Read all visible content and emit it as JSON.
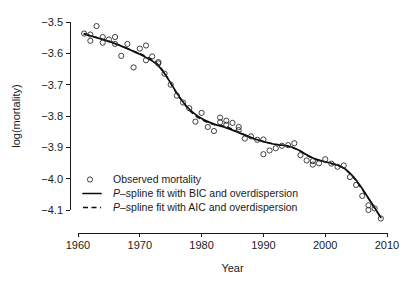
{
  "chart_data": {
    "type": "scatter",
    "title": "",
    "xlabel": "Year",
    "ylabel": "log(mortality)",
    "xlim": [
      1958.5,
      2010.8
    ],
    "ylim": [
      -4.165,
      -3.475
    ],
    "grid": false,
    "legend_position": "bottom-left",
    "xticks": [
      1960,
      1970,
      1980,
      1990,
      2000,
      2010
    ],
    "xtick_labels": [
      "1960",
      "1970",
      "1980",
      "1990",
      "2000",
      "2010"
    ],
    "yticks": [
      -3.5,
      -3.6,
      -3.7,
      -3.8,
      -3.9,
      -4.0,
      -4.1
    ],
    "ytick_labels": [
      "-3.5",
      "-3.6",
      "-3.7",
      "-3.8",
      "-3.9",
      "-4.0",
      "-4.1"
    ],
    "legend": [
      {
        "key": "observed",
        "marker": "circle",
        "label_plain": "Observed mortality",
        "label_prefix": "",
        "label_rest": "Observed mortality"
      },
      {
        "key": "bic",
        "marker": "solid-line",
        "label_plain": "P-spline fit with BIC and overdispersion",
        "label_prefix": "P",
        "label_rest": "–spline fit with BIC and overdispersion"
      },
      {
        "key": "aic",
        "marker": "dashed-line",
        "label_plain": "P-spline fit with AIC and overdispersion",
        "label_prefix": "P",
        "label_rest": "–spline fit with AIC and overdispersion"
      }
    ],
    "series": [
      {
        "name": "Observed mortality",
        "type": "scatter",
        "x": [
          1961,
          1962,
          1962,
          1963,
          1964,
          1964,
          1965,
          1966,
          1966,
          1967,
          1968,
          1969,
          1970,
          1971,
          1971,
          1972,
          1973,
          1973,
          1974,
          1975,
          1976,
          1977,
          1978,
          1979,
          1980,
          1981,
          1982,
          1983,
          1983,
          1984,
          1984,
          1985,
          1986,
          1986,
          1987,
          1988,
          1989,
          1990,
          1990,
          1991,
          1992,
          1993,
          1994,
          1995,
          1996,
          1997,
          1998,
          1998,
          1999,
          2000,
          2001,
          2002,
          2003,
          2004,
          2005,
          2006,
          2007,
          2007,
          2008,
          2009
        ],
        "y": [
          -3.537,
          -3.54,
          -3.56,
          -3.513,
          -3.548,
          -3.566,
          -3.556,
          -3.548,
          -3.57,
          -3.608,
          -3.57,
          -3.645,
          -3.585,
          -3.575,
          -3.622,
          -3.61,
          -3.632,
          -3.628,
          -3.665,
          -3.7,
          -3.735,
          -3.757,
          -3.775,
          -3.818,
          -3.79,
          -3.835,
          -3.848,
          -3.805,
          -3.82,
          -3.815,
          -3.828,
          -3.822,
          -3.835,
          -3.845,
          -3.872,
          -3.865,
          -3.876,
          -3.875,
          -3.922,
          -3.91,
          -3.903,
          -3.895,
          -3.893,
          -3.887,
          -3.925,
          -3.942,
          -3.944,
          -3.955,
          -3.951,
          -3.938,
          -3.952,
          -3.962,
          -3.958,
          -3.995,
          -4.02,
          -4.055,
          -4.1,
          -4.085,
          -4.095,
          -4.127
        ]
      },
      {
        "name": "P-spline fit with BIC and overdispersion",
        "type": "line",
        "style": "solid",
        "x": [
          1961,
          1962,
          1963,
          1964,
          1965,
          1966,
          1967,
          1968,
          1969,
          1970,
          1971,
          1972,
          1973,
          1974,
          1975,
          1976,
          1977,
          1978,
          1979,
          1980,
          1981,
          1982,
          1983,
          1984,
          1985,
          1986,
          1987,
          1988,
          1989,
          1990,
          1991,
          1992,
          1993,
          1994,
          1995,
          1996,
          1997,
          1998,
          1999,
          2000,
          2001,
          2002,
          2003,
          2004,
          2005,
          2006,
          2007,
          2008,
          2009
        ],
        "y": [
          -3.538,
          -3.544,
          -3.55,
          -3.556,
          -3.562,
          -3.569,
          -3.577,
          -3.585,
          -3.594,
          -3.603,
          -3.613,
          -3.624,
          -3.64,
          -3.664,
          -3.695,
          -3.727,
          -3.755,
          -3.778,
          -3.795,
          -3.808,
          -3.818,
          -3.826,
          -3.832,
          -3.838,
          -3.845,
          -3.853,
          -3.861,
          -3.869,
          -3.876,
          -3.882,
          -3.887,
          -3.891,
          -3.893,
          -3.896,
          -3.902,
          -3.912,
          -3.924,
          -3.934,
          -3.941,
          -3.946,
          -3.951,
          -3.957,
          -3.966,
          -3.982,
          -4.004,
          -4.032,
          -4.062,
          -4.093,
          -4.124
        ]
      },
      {
        "name": "P-spline fit with AIC and overdispersion",
        "type": "line",
        "style": "dashed",
        "x": [
          1961,
          1962,
          1963,
          1964,
          1965,
          1966,
          1967,
          1968,
          1969,
          1970,
          1971,
          1972,
          1973,
          1974,
          1975,
          1976,
          1977,
          1978,
          1979,
          1980,
          1981,
          1982,
          1983,
          1984,
          1985,
          1986,
          1987,
          1988,
          1989,
          1990,
          1991,
          1992,
          1993,
          1994,
          1995,
          1996,
          1997,
          1998,
          1999,
          2000,
          2001,
          2002,
          2003,
          2004,
          2005,
          2006,
          2007,
          2008,
          2009
        ],
        "y": [
          -3.537,
          -3.543,
          -3.549,
          -3.555,
          -3.561,
          -3.568,
          -3.576,
          -3.584,
          -3.593,
          -3.601,
          -3.61,
          -3.62,
          -3.637,
          -3.663,
          -3.696,
          -3.729,
          -3.757,
          -3.781,
          -3.799,
          -3.812,
          -3.821,
          -3.827,
          -3.83,
          -3.834,
          -3.842,
          -3.851,
          -3.86,
          -3.868,
          -3.875,
          -3.881,
          -3.886,
          -3.89,
          -3.893,
          -3.896,
          -3.903,
          -3.913,
          -3.925,
          -3.935,
          -3.942,
          -3.947,
          -3.952,
          -3.958,
          -3.967,
          -3.984,
          -4.007,
          -4.035,
          -4.064,
          -4.094,
          -4.124
        ]
      }
    ]
  }
}
